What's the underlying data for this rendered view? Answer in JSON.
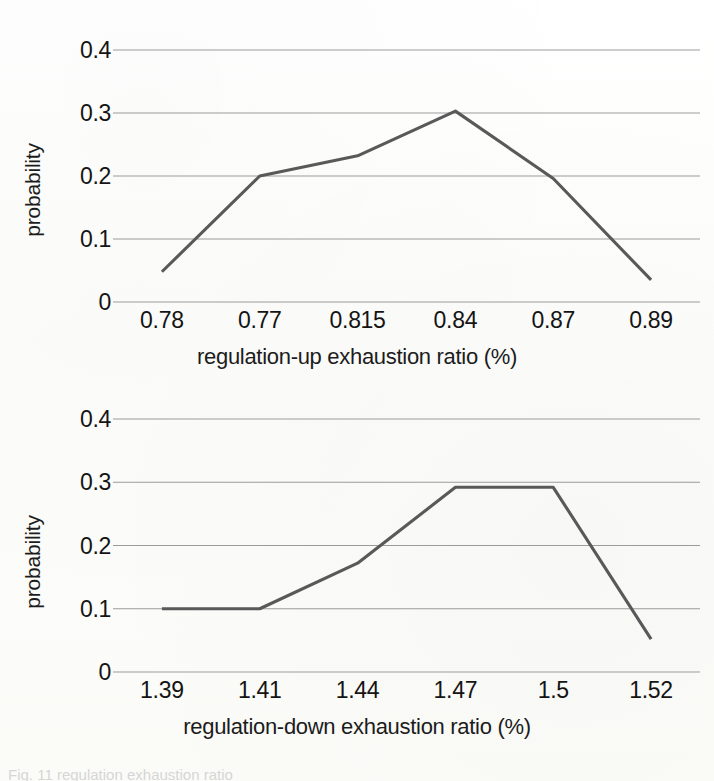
{
  "document": {
    "kind": "scanned-figure-page",
    "caption_fragment": "Fig. 11 regulation exhaustion ratio"
  },
  "style": {
    "gridline_color": "#9b9b9b",
    "series_color": "#595959",
    "text_color": "#141414",
    "page_background": "#fdfdfb"
  },
  "chart_data": [
    {
      "id": "regulation-up",
      "type": "line",
      "title": "",
      "xlabel": "regulation-up exhaustion ratio (%)",
      "ylabel": "probability",
      "categories": [
        "0.78",
        "0.77",
        "0.815",
        "0.84",
        "0.87",
        "0.89"
      ],
      "values": [
        0.048,
        0.2,
        0.232,
        0.303,
        0.196,
        0.035
      ],
      "yticks": [
        "0.4",
        "0.3",
        "0.2",
        "0.1",
        "0"
      ],
      "ytick_values": [
        0.4,
        0.3,
        0.2,
        0.1,
        0
      ],
      "ylim": [
        0,
        0.4
      ],
      "grid": true,
      "legend": "none"
    },
    {
      "id": "regulation-down",
      "type": "line",
      "title": "",
      "xlabel": "regulation-down exhaustion ratio (%)",
      "ylabel": "probability",
      "categories": [
        "1.39",
        "1.41",
        "1.44",
        "1.47",
        "1.5",
        "1.52"
      ],
      "values": [
        0.1,
        0.1,
        0.172,
        0.292,
        0.292,
        0.052
      ],
      "yticks": [
        "0.4",
        "0.3",
        "0.2",
        "0.1",
        "0"
      ],
      "ytick_values": [
        0.4,
        0.3,
        0.2,
        0.1,
        0
      ],
      "ylim": [
        0,
        0.4
      ],
      "grid": true,
      "legend": "none"
    }
  ]
}
